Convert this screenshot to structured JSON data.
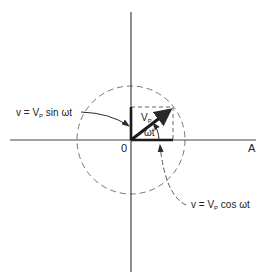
{
  "diagram": {
    "origin_label": "0",
    "axis_label_x": "A",
    "phasor_label_main": "V",
    "phasor_label_sub": "P",
    "angle_label": "ωt",
    "sine_annotation": {
      "prefix": "v = V",
      "sub": "P",
      "suffix": " sin ωt"
    },
    "cosine_annotation": {
      "prefix": "v = V",
      "sub": "P",
      "suffix": " cos ωt"
    },
    "colors": {
      "line": "#2a2a2a",
      "dashed": "#777777",
      "background": "#ffffff"
    }
  }
}
